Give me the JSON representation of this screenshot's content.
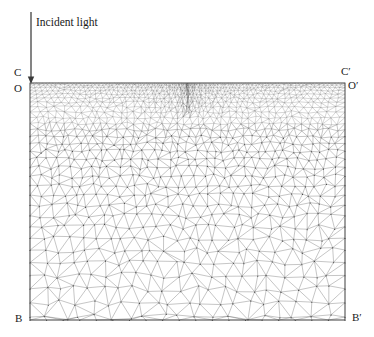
{
  "figure": {
    "title_text": "Incident light",
    "background_color": "#ffffff",
    "line_color": "#555555",
    "node_color": "#333333",
    "boundary_color": "#4a4a4a"
  },
  "annotations": {
    "incident_light": "Incident light",
    "corner_top_left_outer": "C",
    "corner_top_left_inner": "O",
    "corner_top_right_outer": "C′",
    "corner_top_right_inner": "O′",
    "corner_bottom_left": "B",
    "corner_bottom_right": "B′"
  },
  "chart_data": {
    "type": "diagram",
    "subtype": "finite-element-mesh",
    "title": "Incident light",
    "domain": {
      "shape": "rectangle",
      "x_left_px": 30,
      "x_right_px": 345,
      "y_top_px": 83,
      "y_bottom_px": 320,
      "width_px": 315,
      "height_px": 237
    },
    "corner_labels": [
      {
        "name": "C",
        "x_px": 30,
        "y_px": 83,
        "position": "top-left-outer"
      },
      {
        "name": "O",
        "x_px": 30,
        "y_px": 83,
        "position": "top-left-inner"
      },
      {
        "name": "C′",
        "x_px": 345,
        "y_px": 83,
        "position": "top-right-outer"
      },
      {
        "name": "O′",
        "x_px": 345,
        "y_px": 83,
        "position": "top-right-inner"
      },
      {
        "name": "B",
        "x_px": 30,
        "y_px": 320,
        "position": "bottom-left"
      },
      {
        "name": "B′",
        "x_px": 345,
        "y_px": 320,
        "position": "bottom-right"
      }
    ],
    "arrow": {
      "label": "Incident light",
      "x_px": 31,
      "y_start_px": 12,
      "y_end_px": 84,
      "direction": "down",
      "points_to": "O"
    },
    "mesh_grading": {
      "top_edge_element_size_px": 2.2,
      "bottom_edge_element_size_px": 17,
      "corner_O_element_size_px": 1.1,
      "grading_law": "geometric refinement toward top surface",
      "element_type": "triangle",
      "node_markers": true
    }
  }
}
